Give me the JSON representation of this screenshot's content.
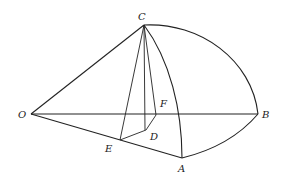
{
  "diagram": {
    "type": "solid geometry figure (spherical sector / quarter-ball section)",
    "points": {
      "O": {
        "label": "O",
        "x": 31,
        "y": 114
      },
      "C": {
        "label": "C",
        "x": 144,
        "y": 25
      },
      "B": {
        "label": "B",
        "x": 258,
        "y": 114
      },
      "A": {
        "label": "A",
        "x": 182,
        "y": 158
      },
      "E": {
        "label": "E",
        "x": 120,
        "y": 140
      },
      "D": {
        "label": "D",
        "x": 146,
        "y": 130
      },
      "F": {
        "label": "F",
        "x": 156,
        "y": 115
      }
    },
    "segments": [
      "OC",
      "OB",
      "OA",
      "CE",
      "CD",
      "CF",
      "ED",
      "DF"
    ],
    "arcs": [
      "CB",
      "CA",
      "AB"
    ],
    "labels": [
      "O",
      "C",
      "B",
      "A",
      "E",
      "D",
      "F"
    ]
  }
}
